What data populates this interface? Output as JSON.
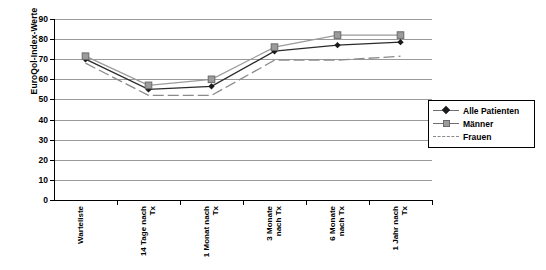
{
  "chart_data": {
    "type": "line",
    "title": "",
    "xlabel": "",
    "ylabel": "EuroQol-Index-Werte",
    "ylim": [
      0,
      90
    ],
    "yticks": [
      0,
      10,
      20,
      30,
      40,
      50,
      60,
      70,
      80,
      90
    ],
    "grid": true,
    "legend_position": "right",
    "categories": [
      "Warteliste",
      "14 Tage nach\nTx",
      "1 Monat nach\nTx",
      "3 Monate\nnach Tx",
      "6 Monate\nnach Tx",
      "1 Jahr nach\nTx"
    ],
    "series": [
      {
        "name": "Alle Patienten",
        "marker": "diamond",
        "color": "#2b2b2b",
        "line_style": "solid",
        "values": [
          70,
          55,
          56.5,
          74,
          77,
          78.5
        ]
      },
      {
        "name": "Männer",
        "marker": "square",
        "color": "#9b9b9b",
        "line_style": "solid",
        "values": [
          71.5,
          57,
          60,
          76,
          82,
          82
        ]
      },
      {
        "name": "Frauen",
        "marker": "none",
        "color": "#8a8a8a",
        "line_style": "dashed",
        "values": [
          68,
          52,
          52,
          69.5,
          69.5,
          71.5
        ]
      }
    ]
  },
  "legend": {
    "items": [
      {
        "label": "Alle Patienten"
      },
      {
        "label": "Männer"
      },
      {
        "label": "Frauen"
      }
    ]
  },
  "axis": {
    "y_title": "EuroQol-Index-Werte"
  }
}
